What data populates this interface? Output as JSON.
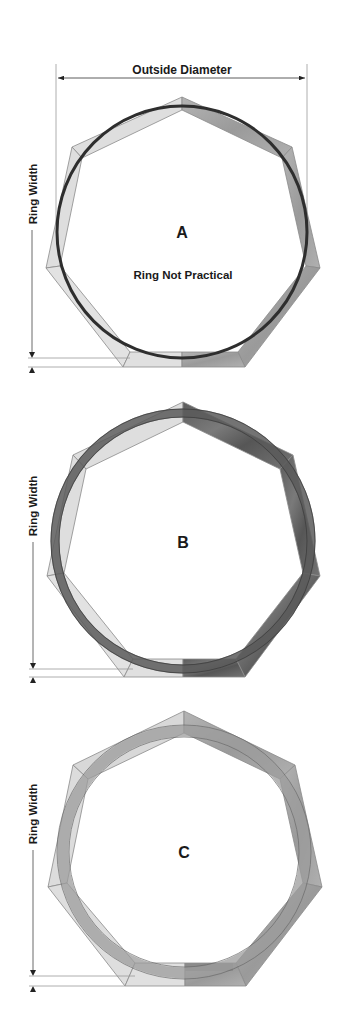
{
  "dimension_label_top": "Outside Diameter",
  "ring_width_label": "Ring Width",
  "colors": {
    "light_segment": "#dcdcdc",
    "dark_segment": "#6e6e6e",
    "medium_segment": "#a8a8a8",
    "outline": "#8a8a8a",
    "ring_stroke": "#333333",
    "dimension_line": "#555555"
  },
  "diagrams": [
    {
      "id": "A",
      "letter": "A",
      "note": "Ring Not Practical",
      "ring_style": "thin line circle"
    },
    {
      "id": "B",
      "letter": "B",
      "note": "",
      "ring_style": "ring touching inner edge and outer corners"
    },
    {
      "id": "C",
      "letter": "C",
      "note": "",
      "ring_style": "ring centered within segments"
    }
  ]
}
